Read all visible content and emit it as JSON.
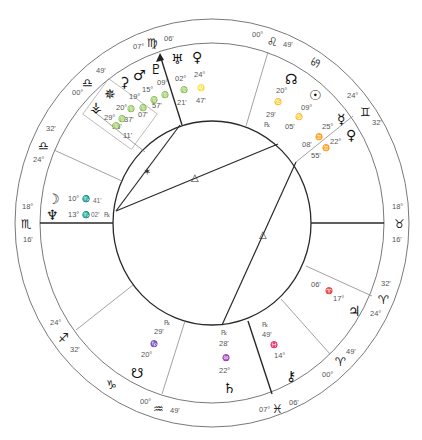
{
  "chart": {
    "type": "natal-wheel",
    "cusps": [
      {
        "id": "asc",
        "sign": "♏",
        "sign_name": "scorpio",
        "deg": "18°",
        "min": "16'"
      },
      {
        "id": "c2",
        "sign": "♐",
        "sign_name": "sagittarius",
        "deg": "24°",
        "min": "32'"
      },
      {
        "id": "c3",
        "sign": "♑",
        "sign_name": "capricorn",
        "deg": "",
        "min": ""
      },
      {
        "id": "c4",
        "sign": "♒",
        "sign_name": "aquarius",
        "deg": "00°",
        "min": "49'"
      },
      {
        "id": "c5",
        "sign": "♓",
        "sign_name": "pisces",
        "deg": "07°",
        "min": "06'"
      },
      {
        "id": "c6",
        "sign": "♈",
        "sign_name": "aries",
        "deg": "00°",
        "min": "49'"
      },
      {
        "id": "c6b",
        "sign": "♈",
        "sign_name": "aries",
        "deg": "24°",
        "min": "32'"
      },
      {
        "id": "dsc",
        "sign": "♉",
        "sign_name": "taurus",
        "deg": "18°",
        "min": "16'"
      },
      {
        "id": "c8",
        "sign": "♊",
        "sign_name": "gemini",
        "deg": "24°",
        "min": "32'"
      },
      {
        "id": "c9",
        "sign": "♋",
        "sign_name": "cancer",
        "deg": "",
        "min": ""
      },
      {
        "id": "c10",
        "sign": "♌",
        "sign_name": "leo",
        "deg": "00°",
        "min": "49'"
      },
      {
        "id": "mc",
        "sign": "♍",
        "sign_name": "virgo",
        "deg": "07°",
        "min": "06'"
      },
      {
        "id": "c11",
        "sign": "♎",
        "sign_name": "libra",
        "deg": "00°",
        "min": "49'"
      },
      {
        "id": "c12",
        "sign": "♎",
        "sign_name": "libra",
        "deg": "24°",
        "min": "32'"
      }
    ],
    "planets": [
      {
        "name": "moon",
        "glyph": "☽",
        "deg": "10°",
        "sign": "♏",
        "min": "41'",
        "retro": ""
      },
      {
        "name": "neptune",
        "glyph": "♆",
        "deg": "13°",
        "sign": "♏",
        "min": "02'",
        "retro": "℞"
      },
      {
        "name": "pluto",
        "glyph": "♇",
        "deg": "09°",
        "sign": "♍",
        "min": "57'",
        "retro": ""
      },
      {
        "name": "mars",
        "glyph": "♂",
        "deg": "15°",
        "sign": "♍",
        "min": "07'",
        "retro": ""
      },
      {
        "name": "ceres",
        "glyph": "⚳",
        "deg": "19°",
        "sign": "♍",
        "min": "37'",
        "retro": ""
      },
      {
        "name": "pallas",
        "glyph": "✵",
        "deg": "20°",
        "sign": "♍",
        "min": "55'",
        "retro": ""
      },
      {
        "name": "vesta",
        "glyph": "⚶",
        "deg": "29°",
        "sign": "♍",
        "min": "11'",
        "retro": ""
      },
      {
        "name": "uranus",
        "glyph": "♅",
        "deg": "02°",
        "sign": "♍",
        "min": "21'",
        "retro": ""
      },
      {
        "name": "venus-leo",
        "glyph": "♀",
        "deg": "24°",
        "sign": "♌",
        "min": "47'",
        "retro": ""
      },
      {
        "name": "north-node",
        "glyph": "☊",
        "deg": "20°",
        "sign": "♋",
        "min": "29'",
        "retro": "℞"
      },
      {
        "name": "sun",
        "glyph": "☉",
        "deg": "09°",
        "sign": "♋",
        "min": "05'",
        "retro": ""
      },
      {
        "name": "mercury",
        "glyph": "☿",
        "deg": "25°",
        "sign": "♊",
        "min": "08'",
        "retro": ""
      },
      {
        "name": "venus",
        "glyph": "♀",
        "deg": "22°",
        "sign": "♊",
        "min": "55'",
        "retro": ""
      },
      {
        "name": "jupiter",
        "glyph": "♃",
        "deg": "17°",
        "sign": "♈",
        "min": "06'",
        "retro": ""
      },
      {
        "name": "chiron",
        "glyph": "⚷",
        "deg": "14°",
        "sign": "♓",
        "min": "49'",
        "retro": "℞"
      },
      {
        "name": "saturn",
        "glyph": "♄",
        "deg": "22°",
        "sign": "♒",
        "min": "28'",
        "retro": "℞"
      },
      {
        "name": "south-node",
        "glyph": "☋",
        "deg": "20°",
        "sign": "♑",
        "min": "29'",
        "retro": "℞"
      }
    ],
    "aspects": [
      {
        "type": "sextile",
        "glyph": "✶"
      },
      {
        "type": "trine",
        "glyph": "△"
      },
      {
        "type": "trine",
        "glyph": "△"
      }
    ],
    "mc_label": {
      "deg": "07°",
      "sign": "♍",
      "min": "06'"
    }
  }
}
